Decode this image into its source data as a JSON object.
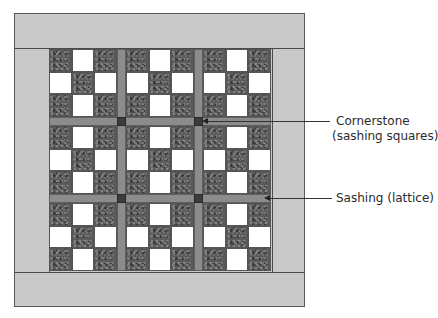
{
  "diagram": {
    "colors": {
      "border": "#c9c9c9",
      "sashing": "#8c8c8c",
      "cornerstone": "#3b3b3b",
      "dark_square": "#5a5a5a",
      "light_square": "#ffffff",
      "outline": "#4a4a4a"
    },
    "grid": {
      "blocks_per_row": 3,
      "blocks_per_col": 3,
      "block_type": "nine-patch",
      "pattern": [
        "dark",
        "light",
        "dark",
        "light",
        "dark",
        "light",
        "dark",
        "light",
        "dark"
      ]
    },
    "callouts": [
      {
        "id": "cornerstone",
        "line1": "Cornerstone",
        "line2": "(sashing squares)"
      },
      {
        "id": "sashing",
        "line1": "Sashing (lattice)"
      }
    ]
  }
}
